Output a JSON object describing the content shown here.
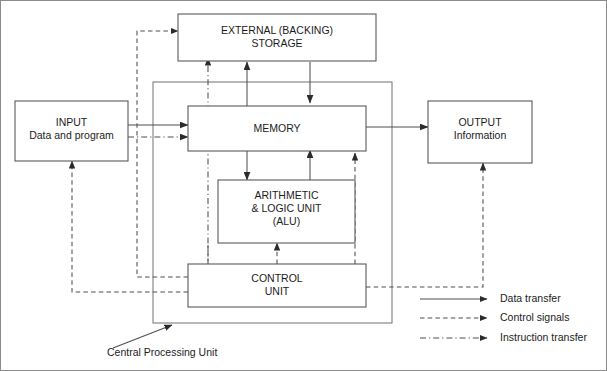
{
  "diagram": {
    "boxes": {
      "external_storage": {
        "line1": "EXTERNAL (BACKING)",
        "line2": "STORAGE"
      },
      "input": {
        "line1": "INPUT",
        "line2": "Data and program"
      },
      "memory": {
        "line1": "MEMORY"
      },
      "output": {
        "line1": "OUTPUT",
        "line2": "Information"
      },
      "alu": {
        "line1": "ARITHMETIC",
        "line2": "& LOGIC UNIT",
        "line3": "(ALU)"
      },
      "control_unit": {
        "line1": "CONTROL",
        "line2": "UNIT"
      }
    },
    "caption": {
      "cpu": "Central Processing Unit"
    },
    "legend": {
      "items": [
        {
          "label": "Data transfer",
          "style": "solid"
        },
        {
          "label": "Control signals",
          "style": "dashed"
        },
        {
          "label": "Instruction transfer",
          "style": "dash-dot"
        }
      ]
    },
    "colors": {
      "background": "#ffffff",
      "box_stroke": "#5a5a5a",
      "line_stroke": "#4f4f4f",
      "text": "#1c1c1c",
      "outer_border": "#8c8c8c"
    }
  }
}
